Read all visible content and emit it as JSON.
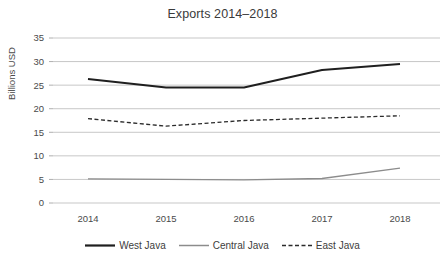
{
  "chart_data": {
    "type": "line",
    "title": "Exports 2014–2018",
    "xlabel": "",
    "ylabel": "Billions USD",
    "categories": [
      "2014",
      "2015",
      "2016",
      "2017",
      "2018"
    ],
    "x": [
      2014,
      2015,
      2016,
      2017,
      2018
    ],
    "ylim": [
      0,
      35
    ],
    "yticks": [
      "0",
      "5",
      "10",
      "15",
      "20",
      "25",
      "30",
      "35"
    ],
    "ytick_values": [
      0,
      5,
      10,
      15,
      20,
      25,
      30,
      35
    ],
    "grid": true,
    "legend_position": "bottom",
    "series": [
      {
        "name": "West Java",
        "values": [
          26.3,
          24.5,
          24.5,
          28.2,
          29.5
        ],
        "style": "solid",
        "color": "#1f1f1f",
        "width": 2.0
      },
      {
        "name": "Central Java",
        "values": [
          5.1,
          5.0,
          4.9,
          5.2,
          7.4
        ],
        "style": "solid",
        "color": "#8c8c8c",
        "width": 1.3
      },
      {
        "name": "East Java",
        "values": [
          17.9,
          16.3,
          17.5,
          18.0,
          18.5
        ],
        "style": "dashed",
        "color": "#2b2b2b",
        "width": 1.3
      }
    ]
  },
  "colors": {
    "background": "#ffffff",
    "gridline": "#b9b9b9",
    "text": "#404040"
  }
}
